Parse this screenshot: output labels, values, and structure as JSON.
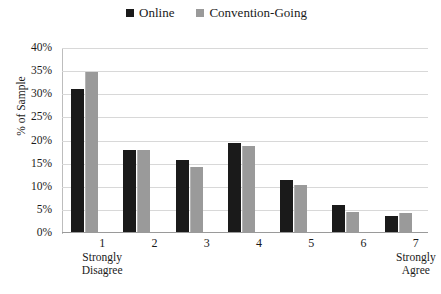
{
  "chart_data": {
    "type": "bar",
    "title": "",
    "xlabel": "",
    "ylabel": "% of Sample",
    "ylim": [
      0,
      40
    ],
    "yticks": [
      "0%",
      "5%",
      "10%",
      "15%",
      "20%",
      "25%",
      "30%",
      "35%",
      "40%"
    ],
    "ytick_values": [
      0,
      5,
      10,
      15,
      20,
      25,
      30,
      35,
      40
    ],
    "grid": true,
    "legend_position": "top-center",
    "categories": [
      "1",
      "2",
      "3",
      "4",
      "5",
      "6",
      "7"
    ],
    "category_captions": [
      "Strongly\nDisagree",
      "",
      "",
      "",
      "",
      "",
      "Strongly\nAgree"
    ],
    "series": [
      {
        "name": "Online",
        "color": "#1a1a1a",
        "values": [
          31.0,
          17.7,
          15.5,
          19.3,
          11.2,
          5.9,
          3.4
        ]
      },
      {
        "name": "Convention-Going",
        "color": "#9a9a9a",
        "values": [
          34.6,
          17.7,
          14.0,
          18.7,
          10.2,
          4.3,
          4.1
        ]
      }
    ]
  },
  "axis": {
    "y_title": "% of Sample"
  },
  "xtick_labels": [
    {
      "num": "1",
      "line1": "Strongly",
      "line2": "Disagree"
    },
    {
      "num": "2",
      "line1": "",
      "line2": ""
    },
    {
      "num": "3",
      "line1": "",
      "line2": ""
    },
    {
      "num": "4",
      "line1": "",
      "line2": ""
    },
    {
      "num": "5",
      "line1": "",
      "line2": ""
    },
    {
      "num": "6",
      "line1": "",
      "line2": ""
    },
    {
      "num": "7",
      "line1": "Strongly",
      "line2": "Agree"
    }
  ]
}
